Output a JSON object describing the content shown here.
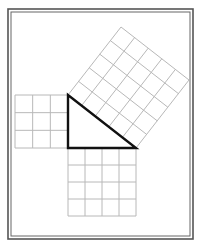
{
  "diagram": {
    "colors": {
      "background": "#ffffff",
      "frame": "#555555",
      "grid": "#b8b8b8",
      "triangle": "#111111"
    },
    "triangle": {
      "legs": [
        3,
        4
      ],
      "hypotenuse": 5,
      "vertices": {
        "top": [
          68,
          95
        ],
        "right_angle": [
          68,
          148
        ],
        "right": [
          136,
          148
        ]
      }
    },
    "squares": [
      {
        "name": "left-leg-square",
        "side_units": 3,
        "cells": 9
      },
      {
        "name": "bottom-leg-square",
        "side_units": 4,
        "cells": 16
      },
      {
        "name": "hypotenuse-square",
        "side_units": 5,
        "cells": 25
      }
    ]
  }
}
